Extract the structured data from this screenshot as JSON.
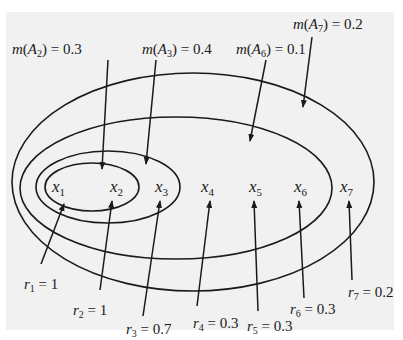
{
  "diagram": {
    "type": "nested-sets",
    "elements": [
      {
        "name": "x",
        "sub": "1",
        "x": 52,
        "y": 178
      },
      {
        "name": "x",
        "sub": "2",
        "x": 110,
        "y": 178
      },
      {
        "name": "x",
        "sub": "3",
        "x": 155,
        "y": 178
      },
      {
        "name": "x",
        "sub": "4",
        "x": 201,
        "y": 178
      },
      {
        "name": "x",
        "sub": "5",
        "x": 249,
        "y": 178
      },
      {
        "name": "x",
        "sub": "6",
        "x": 294,
        "y": 178
      },
      {
        "name": "x",
        "sub": "7",
        "x": 340,
        "y": 178
      }
    ],
    "sets": [
      {
        "id": "A2",
        "cx": 92,
        "cy": 187,
        "rx": 47,
        "ry": 24
      },
      {
        "id": "A3",
        "cx": 108,
        "cy": 187,
        "rx": 72,
        "ry": 36
      },
      {
        "id": "A6",
        "cx": 176,
        "cy": 188,
        "rx": 156,
        "ry": 71
      },
      {
        "id": "A7",
        "cx": 193,
        "cy": 182,
        "rx": 181,
        "ry": 109
      }
    ],
    "mass_labels": [
      {
        "prefix": "m(A",
        "sub": "2",
        "suffix": ") = 0.3",
        "x": 12,
        "y": 42,
        "ax1": 108,
        "ay1": 60,
        "ax2": 102,
        "ay2": 169
      },
      {
        "prefix": "m(A",
        "sub": "3",
        "suffix": ") = 0.4",
        "x": 142,
        "y": 42,
        "ax1": 156,
        "ay1": 60,
        "ax2": 146,
        "ay2": 164
      },
      {
        "prefix": "m(A",
        "sub": "6",
        "suffix": ") = 0.1",
        "x": 236,
        "y": 42,
        "ax1": 266,
        "ay1": 60,
        "ax2": 250,
        "ay2": 141
      },
      {
        "prefix": "m(A",
        "sub": "7",
        "suffix": ") = 0.2",
        "x": 293,
        "y": 17,
        "ax1": 312,
        "ay1": 37,
        "ax2": 303,
        "ay2": 107
      }
    ],
    "possibility_labels": [
      {
        "prefix": "r",
        "sub": "1",
        "suffix": " = 1",
        "x": 24,
        "y": 277,
        "ax1": 41,
        "ay1": 264,
        "ax2": 64,
        "ay2": 204
      },
      {
        "prefix": "r",
        "sub": "2",
        "suffix": " = 1",
        "x": 73,
        "y": 303,
        "ax1": 100,
        "ay1": 290,
        "ax2": 112,
        "ay2": 201
      },
      {
        "prefix": "r",
        "sub": "3",
        "suffix": " = 0.7",
        "x": 126,
        "y": 322,
        "ax1": 143,
        "ay1": 316,
        "ax2": 160,
        "ay2": 201
      },
      {
        "prefix": "r",
        "sub": "4",
        "suffix": " = 0.3",
        "x": 193,
        "y": 316,
        "ax1": 197,
        "ay1": 306,
        "ax2": 210,
        "ay2": 201
      },
      {
        "prefix": "r",
        "sub": "5",
        "suffix": " = 0.3",
        "x": 247,
        "y": 319,
        "ax1": 258,
        "ay1": 311,
        "ax2": 254,
        "ay2": 201
      },
      {
        "prefix": "r",
        "sub": "6",
        "suffix": " = 0.3",
        "x": 290,
        "y": 302,
        "ax1": 304,
        "ay1": 298,
        "ax2": 299,
        "ay2": 201
      },
      {
        "prefix": "r",
        "sub": "7",
        "suffix": " = 0.2",
        "x": 348,
        "y": 285,
        "ax1": 352,
        "ay1": 280,
        "ax2": 349,
        "ay2": 201
      }
    ],
    "colors": {
      "stroke": "#1a1a1a",
      "background": "#f1f1f1"
    }
  }
}
